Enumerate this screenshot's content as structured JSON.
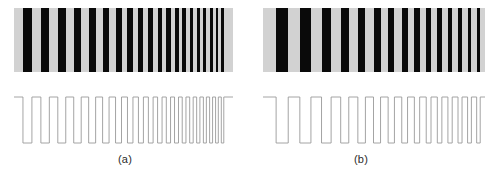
{
  "figure": {
    "name": "chirped-bar-pattern-figure",
    "background_color": "#ffffff",
    "width": 501,
    "height": 177
  },
  "style": {
    "bar_dark_color": "#0a0a0a",
    "bar_light_color": "#d2d2d2",
    "wave_line_color": "#9a9a9a",
    "wave_line_width": 0.9,
    "label_color": "#2b2b2b"
  },
  "panels": [
    {
      "id": "a",
      "label": "(a)",
      "patch": {
        "name": "bar-pattern-a",
        "x": 14,
        "y": 8,
        "width": 219,
        "height": 64
      },
      "waveform": {
        "name": "intensity-waveform-a",
        "x": 14,
        "y": 92,
        "width": 219,
        "height": 56,
        "high_level": 5,
        "low_level": 51
      },
      "chart_data": {
        "type": "bar",
        "title": "(a)",
        "xlabel": "",
        "ylabel": "",
        "description": "Chirped square-wave bar target: black bars on light gray, spatial frequency increases left to right. Below it the corresponding intensity profile (square wave) is plotted; amplitude (modulation) stays constant across all frequencies.",
        "grid": false,
        "legend": false,
        "xlim": [
          0,
          219
        ],
        "ylim": [
          0,
          1
        ],
        "amplitude_constant": true,
        "bar_edges_px": [
          [
            18.0,
            36.0
          ],
          [
            54.0,
            71.0
          ],
          [
            88.0,
            104.0
          ],
          [
            120.0,
            135.0
          ],
          [
            150.0,
            164.0
          ],
          [
            178.0,
            191.0
          ],
          [
            204.0,
            216.0
          ],
          [
            228.0,
            239.0
          ],
          [
            250.0,
            260.0
          ],
          [
            270.0,
            279.5
          ],
          [
            288.5,
            297.5
          ],
          [
            306.0,
            314.5
          ],
          [
            322.5,
            330.5
          ],
          [
            338.0,
            345.5
          ],
          [
            353.0,
            360.0
          ],
          [
            367.0,
            373.5
          ],
          [
            380.5,
            386.5
          ],
          [
            393.0,
            399.0
          ],
          [
            405.0,
            410.5
          ],
          [
            416.5,
            421.5
          ]
        ],
        "note": "bar_edges_px are in a 0-440 normalized pattern space mapped onto the patch width"
      }
    },
    {
      "id": "b",
      "label": "(b)",
      "patch": {
        "name": "bar-pattern-b",
        "x": 263,
        "y": 8,
        "width": 222,
        "height": 64
      },
      "waveform": {
        "name": "intensity-waveform-b",
        "x": 263,
        "y": 92,
        "width": 222,
        "height": 56,
        "high_level": 5,
        "low_level": 51
      },
      "chart_data": {
        "type": "bar",
        "title": "(b)",
        "xlabel": "",
        "ylabel": "",
        "description": "Chirped square-wave bar target with a different starting phase and duty cycle than (a); spatial frequency again increases left to right with constant modulation amplitude.",
        "grid": false,
        "legend": false,
        "xlim": [
          0,
          222
        ],
        "ylim": [
          0,
          1
        ],
        "amplitude_constant": true,
        "bar_edges_px": [
          [
            26.0,
            50.0
          ],
          [
            73.0,
            95.0
          ],
          [
            116.0,
            135.0
          ],
          [
            154.0,
            170.0
          ],
          [
            188.0,
            203.0
          ],
          [
            219.0,
            233.0
          ],
          [
            248.0,
            260.5
          ],
          [
            275.0,
            286.5
          ],
          [
            300.0,
            310.5
          ],
          [
            323.5,
            333.0
          ],
          [
            345.5,
            354.5
          ],
          [
            366.5,
            375.0
          ],
          [
            386.5,
            394.5
          ],
          [
            405.5,
            413.0
          ],
          [
            423.5,
            430.5
          ]
        ],
        "note": "bar_edges_px are in a 0-440 normalized pattern space mapped onto the patch width"
      }
    }
  ]
}
